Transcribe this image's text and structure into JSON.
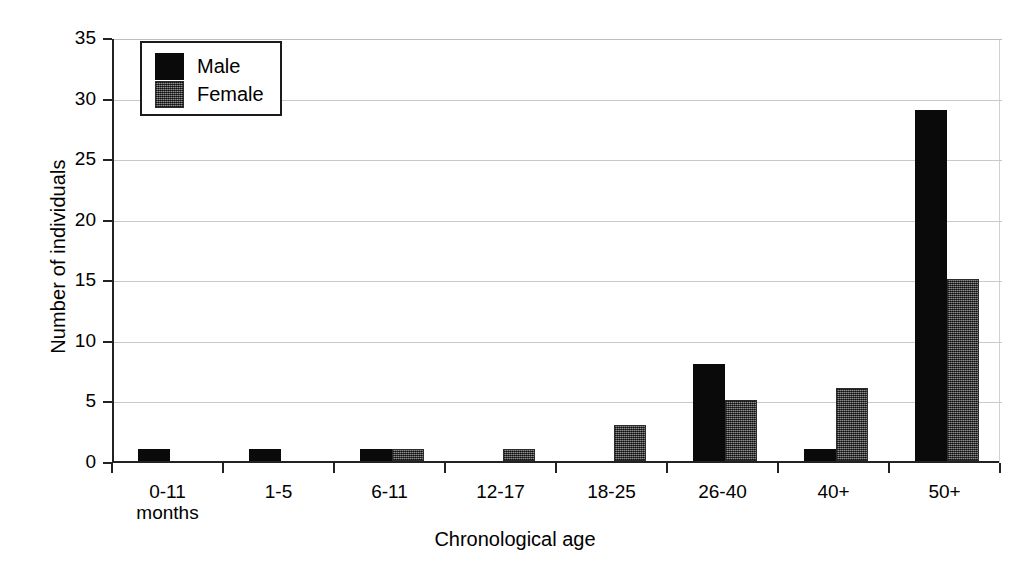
{
  "chart_data": {
    "type": "bar",
    "title": "",
    "xlabel": "Chronological age",
    "ylabel": "Number of individuals",
    "categories": [
      "0-11 months",
      "1-5",
      "6-11",
      "12-17",
      "18-25",
      "26-40",
      "40+",
      "50+"
    ],
    "category_lines": [
      [
        "0-11",
        "months"
      ],
      [
        "1-5"
      ],
      [
        "6-11"
      ],
      [
        "12-17"
      ],
      [
        "18-25"
      ],
      [
        "26-40"
      ],
      [
        "40+"
      ],
      [
        "50+"
      ]
    ],
    "series": [
      {
        "name": "Male",
        "color": "#0a0a0a",
        "values": [
          1,
          1,
          1,
          0,
          0,
          8,
          1,
          29
        ]
      },
      {
        "name": "Female",
        "color": "#4d4d4d",
        "values": [
          0,
          0,
          1,
          1,
          3,
          5,
          6,
          15
        ]
      }
    ],
    "ylim": [
      0,
      35
    ],
    "yticks": [
      0,
      5,
      10,
      15,
      20,
      25,
      30,
      35
    ],
    "ytick_labels": [
      "0",
      "5",
      "10",
      "15",
      "20",
      "25",
      "30",
      "35"
    ],
    "grid": true,
    "grid_axis": "y",
    "legend_position": "top-left",
    "legend_entries": [
      "Male",
      "Female"
    ]
  },
  "scan_artifact": {
    "text": ""
  }
}
